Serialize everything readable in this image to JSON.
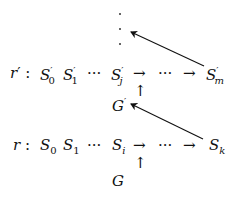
{
  "diagram": {
    "top_row": {
      "label": "r",
      "label_prime": "′",
      "colon": ":",
      "items": [
        {
          "base": "S",
          "prime": "′",
          "sub": "0"
        },
        {
          "base": "S",
          "prime": "′",
          "sub": "1"
        },
        {
          "text": "···"
        },
        {
          "base": "S",
          "prime": "′",
          "sub": "j"
        },
        {
          "text": "→"
        },
        {
          "text": "···"
        },
        {
          "text": "→"
        },
        {
          "base": "S",
          "prime": "′",
          "sub": "m"
        }
      ],
      "below_label": {
        "base": "G",
        "prime": "′"
      },
      "up_arrow": "↑"
    },
    "bottom_row": {
      "label": "r",
      "colon": ":",
      "items": [
        {
          "base": "S",
          "sub": "0"
        },
        {
          "base": "S",
          "sub": "1"
        },
        {
          "text": "···"
        },
        {
          "base": "S",
          "sub": "i"
        },
        {
          "text": "→"
        },
        {
          "text": "···"
        },
        {
          "text": "→"
        },
        {
          "base": "S",
          "sub": "k"
        }
      ],
      "below_label": {
        "base": "G"
      },
      "up_arrow": "↑"
    },
    "vertical_ellipsis": "⋮",
    "edges": [
      {
        "from": "S'_m",
        "to": "vertical-ellipsis",
        "style": "arrow"
      },
      {
        "from": "S_k",
        "to": "G'",
        "style": "arrow"
      },
      {
        "from": "G'",
        "to": "r'-arrow-after-S'_j",
        "style": "up-arrow"
      },
      {
        "from": "G",
        "to": "r-arrow-after-S_i",
        "style": "up-arrow"
      }
    ],
    "colors": {
      "ink": "#111111",
      "background": "#ffffff"
    }
  }
}
